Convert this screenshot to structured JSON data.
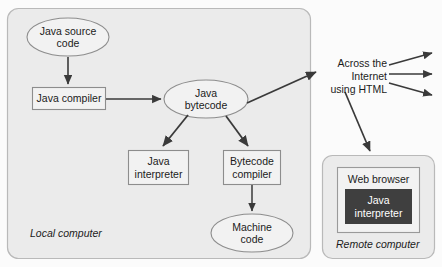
{
  "diagram": {
    "colors": {
      "panel_fill": "#ebebeb",
      "panel_stroke": "#b9b9b9",
      "node_fill": "#f2f2f2",
      "node_stroke": "#8d8d8d",
      "arrow": "#3a3a3a",
      "dark_box_fill": "#3f3f3f",
      "dark_box_text": "#ffffff",
      "page_bg": "#fbfbfb"
    }
  },
  "local_panel": {
    "caption": "Local computer",
    "nodes": {
      "java_source_code": "Java source\ncode",
      "java_compiler": "Java compiler",
      "java_bytecode": "Java\nbytecode",
      "java_interpreter": "Java\ninterpreter",
      "bytecode_compiler": "Bytecode\ncompiler",
      "machine_code": "Machine\ncode"
    }
  },
  "network": {
    "label": "Across the\nInternet\nusing HTML"
  },
  "remote_panel": {
    "caption": "Remote computer",
    "browser_title": "Web browser",
    "interpreter": "Java\ninterpreter"
  }
}
